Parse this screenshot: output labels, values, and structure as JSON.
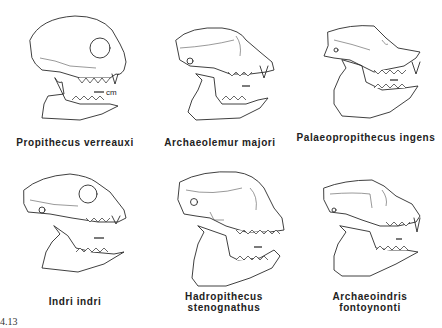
{
  "figure": {
    "number": "4.13",
    "panels": [
      {
        "id": "propithecus",
        "label": "Propithecus verreauxi",
        "scale_label": "cm"
      },
      {
        "id": "archaeolemur",
        "label": "Archaeolemur majori"
      },
      {
        "id": "palaeopropithecus",
        "label": "Palaeopropithecus ingens"
      },
      {
        "id": "indri",
        "label": "Indri indri"
      },
      {
        "id": "hadropithecus",
        "label": "Hadropithecus stenognathus"
      },
      {
        "id": "archaeoindris",
        "label": "Archaeoindris fontoynonti"
      }
    ]
  }
}
